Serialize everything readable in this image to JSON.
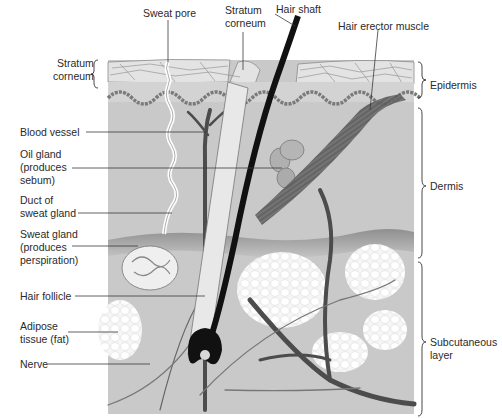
{
  "diagram": {
    "colors": {
      "background": "#ffffff",
      "tissue": "#c9c9c9",
      "epidermis": "#d6d6d6",
      "stratum_corneum": "#e2e2e2",
      "hypodermis_band": "#9f9f9f",
      "adipose": "#f2f2f2",
      "hair": "#111111",
      "vessel": "#4a4a4a",
      "leader_line": "#3a3a3a",
      "label_text": "#2a2a2a"
    },
    "top_labels": [
      {
        "id": "sweat-pore",
        "text": "Sweat pore"
      },
      {
        "id": "stratum-corneum-top",
        "text": "Stratum\ncorneum"
      },
      {
        "id": "hair-shaft",
        "text": "Hair shaft"
      },
      {
        "id": "hair-erector-muscle",
        "text": "Hair erector muscle"
      }
    ],
    "left_labels": [
      {
        "id": "stratum-corneum-left",
        "text": "Stratum\ncorneum"
      },
      {
        "id": "blood-vessel",
        "text": "Blood vessel"
      },
      {
        "id": "oil-gland",
        "text": "Oil gland\n(produces\nsebum)"
      },
      {
        "id": "duct-of-sweat-gland",
        "text": "Duct of\nsweat gland"
      },
      {
        "id": "sweat-gland",
        "text": "Sweat gland\n(produces\nperspiration)"
      },
      {
        "id": "hair-follicle",
        "text": "Hair follicle"
      },
      {
        "id": "adipose-tissue",
        "text": "Adipose\ntissue (fat)"
      },
      {
        "id": "nerve",
        "text": "Nerve"
      }
    ],
    "right_labels": [
      {
        "id": "epidermis",
        "text": "Epidermis"
      },
      {
        "id": "dermis",
        "text": "Dermis"
      },
      {
        "id": "subcutaneous-layer",
        "text": "Subcutaneous\nlayer"
      }
    ]
  }
}
